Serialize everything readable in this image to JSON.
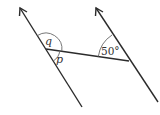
{
  "diagram": {
    "type": "geometry-parallel-lines-transversal",
    "colors": {
      "line": "#2b2b2b",
      "arc": "#555555",
      "text": "#333333",
      "background": "#ffffff"
    },
    "lines": {
      "left_parallel": {
        "x1": 82,
        "y1": 107,
        "x2": 20,
        "y2": 8,
        "arrow": "top"
      },
      "right_parallel": {
        "x1": 158,
        "y1": 102,
        "x2": 96,
        "y2": 8,
        "arrow": "top"
      },
      "transversal": {
        "x1": 46,
        "y1": 49,
        "x2": 129,
        "y2": 61
      }
    },
    "angles": {
      "q": {
        "label": "q",
        "vertex": "left-intersection",
        "position": "above transversal"
      },
      "p": {
        "label": "p",
        "vertex": "left-intersection",
        "position": "below transversal"
      },
      "given": {
        "label": "50°",
        "vertex": "right-intersection",
        "position": "above transversal, left of line"
      }
    }
  }
}
